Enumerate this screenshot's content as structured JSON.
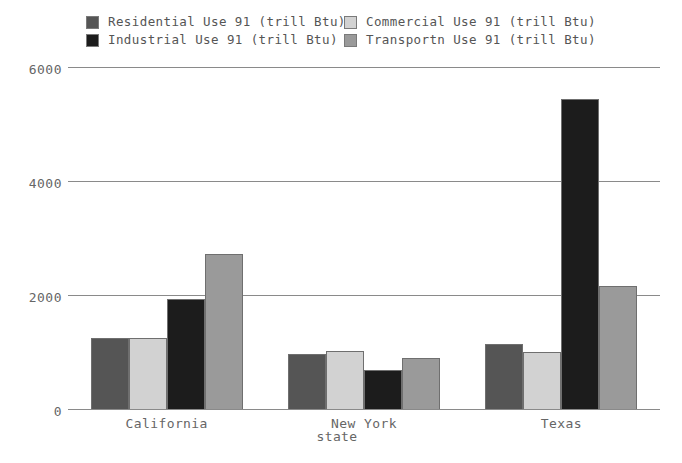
{
  "chart_data": {
    "type": "bar",
    "title": "",
    "xlabel": "state",
    "ylabel": "",
    "categories": [
      "California",
      "New York",
      "Texas"
    ],
    "series": [
      {
        "name": "Residential Use 91 (trill Btu)",
        "color": "#555555",
        "values": [
          1270,
          980,
          1160
        ]
      },
      {
        "name": "Commercial Use 91 (trill Btu)",
        "color": "#d2d2d2",
        "values": [
          1270,
          1030,
          1010
        ]
      },
      {
        "name": "Industrial Use 91 (trill Btu)",
        "color": "#1c1c1c",
        "values": [
          1940,
          700,
          5450
        ]
      },
      {
        "name": "Transportn Use 91 (trill Btu)",
        "color": "#9a9a9a",
        "values": [
          2740,
          920,
          2170
        ]
      }
    ],
    "yticks": [
      "0",
      "2000",
      "4000",
      "6000"
    ],
    "ytick_values": [
      0,
      2000,
      4000,
      6000
    ],
    "ylim": [
      0,
      6000
    ],
    "grid": true,
    "legend_position": "top"
  },
  "legend": {
    "entries": [
      {
        "label": "Residential Use 91 (trill Btu)",
        "color": "#555555"
      },
      {
        "label": "Commercial Use 91 (trill Btu)",
        "color": "#d2d2d2"
      },
      {
        "label": "Industrial Use 91 (trill Btu)",
        "color": "#1c1c1c"
      },
      {
        "label": "Transportn Use 91 (trill Btu)",
        "color": "#9a9a9a"
      }
    ]
  },
  "axes": {
    "y_ticks": [
      {
        "label": "6000",
        "value": 6000
      },
      {
        "label": "4000",
        "value": 4000
      },
      {
        "label": "2000",
        "value": 2000
      },
      {
        "label": "0",
        "value": 0
      }
    ],
    "x_categories": [
      "California",
      "New York",
      "Texas"
    ],
    "x_axis_title": "state"
  }
}
